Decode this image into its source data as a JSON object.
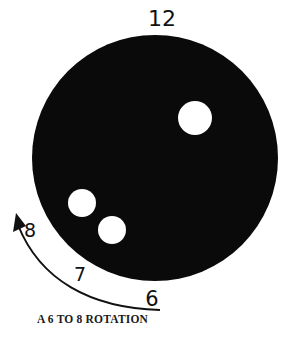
{
  "diagram": {
    "title_label": "12",
    "ball": {
      "color": "#0a0a0a",
      "holes_color": "#ffffff",
      "finger_holes": 2,
      "thumb_holes": 1
    },
    "rotation_labels": {
      "start": "6",
      "middle": "7",
      "end": "8"
    },
    "caption": "A 6 TO 8 ROTATION"
  }
}
